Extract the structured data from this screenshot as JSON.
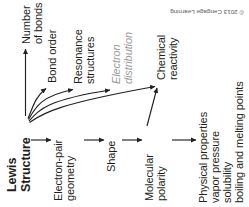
{
  "figure": {
    "orientation": "rotated-90",
    "copyright": "© 2013 Cengage Learning",
    "colors": {
      "text": "#231f20",
      "muted_text": "#9a9a9a",
      "arrow": "#231f20",
      "background": "#ffffff"
    }
  },
  "nodes": {
    "lewis_structure": {
      "line1": "Lewis",
      "line2": "Structure"
    },
    "number_of_bonds": {
      "line1": "Number",
      "line2": "of bonds"
    },
    "bond_order": {
      "line1": "Bond order"
    },
    "resonance_structures": {
      "line1": "Resonance",
      "line2": "structures"
    },
    "electron_distribution": {
      "line1": "Electron",
      "line2": "distribution"
    },
    "chemical_reactivity": {
      "line1": "Chemical",
      "line2": "reactivity"
    },
    "electron_pair_geometry": {
      "line1": "Electron-pair",
      "line2": "geometry"
    },
    "shape": {
      "line1": "Shape"
    },
    "molecular_polarity": {
      "line1": "Molecular",
      "line2": "polarity"
    },
    "physical_properties": {
      "line1": "Physical properties",
      "line2": "vapor pressure",
      "line3": "solubility",
      "line4": "boiling and melting points"
    }
  },
  "edges": [
    {
      "from": "lewis_structure",
      "to": "number_of_bonds",
      "style": "straight"
    },
    {
      "from": "lewis_structure",
      "to": "bond_order",
      "style": "curved"
    },
    {
      "from": "lewis_structure",
      "to": "resonance_structures",
      "style": "curved"
    },
    {
      "from": "lewis_structure",
      "to": "electron_distribution",
      "style": "curved"
    },
    {
      "from": "electron_distribution",
      "to": "chemical_reactivity",
      "style": "straight"
    },
    {
      "from": "lewis_structure",
      "to": "electron_pair_geometry",
      "style": "straight"
    },
    {
      "from": "electron_pair_geometry",
      "to": "shape",
      "style": "straight"
    },
    {
      "from": "shape",
      "to": "molecular_polarity",
      "style": "straight"
    },
    {
      "from": "molecular_polarity",
      "to": "physical_properties",
      "style": "straight"
    },
    {
      "from": "molecular_polarity",
      "to": "chemical_reactivity",
      "style": "diagonal"
    }
  ]
}
